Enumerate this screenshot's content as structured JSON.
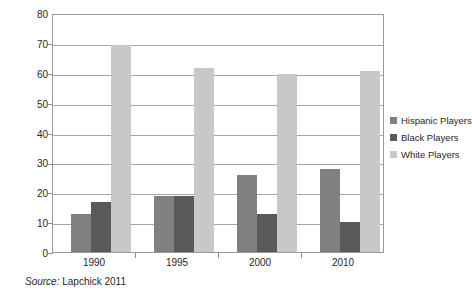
{
  "chart_data": {
    "type": "bar",
    "title": "",
    "subtitle": "",
    "xlabel": "",
    "ylabel": "",
    "categories": [
      "1990",
      "1995",
      "2000",
      "2010"
    ],
    "series": [
      {
        "name": "Hispanic Players",
        "color": "#808080",
        "values": [
          13,
          17,
          26,
          28
        ]
      },
      {
        "name": "Black Players",
        "color": "#595959",
        "values": [
          17,
          19,
          13,
          10
        ]
      },
      {
        "name": "White Players",
        "color": "#c8c8c8",
        "values": [
          70,
          62,
          60,
          61
        ]
      }
    ],
    "ylim": [
      0,
      80
    ],
    "ytick_step": 10,
    "yticks": [
      "80",
      "70",
      "60",
      "50",
      "40",
      "30",
      "20",
      "10",
      "0"
    ],
    "grid": true,
    "grid_axis": "y",
    "legend_position": "right",
    "annotations": {
      "source": {
        "label": "Source:",
        "text": "Lapchick  2011"
      }
    }
  },
  "series_corrected": {
    "hispanic": [
      13,
      19,
      26,
      28
    ],
    "black": [
      17,
      19,
      13,
      10
    ],
    "white": [
      70,
      62,
      60,
      61
    ]
  }
}
